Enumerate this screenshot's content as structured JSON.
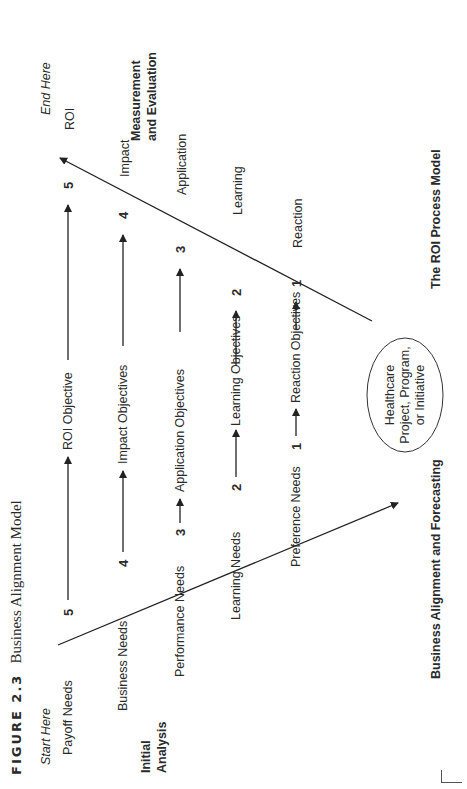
{
  "figure": {
    "label": "FIGURE 2.3",
    "title": "Business Alignment Model"
  },
  "start_label": "Start Here",
  "end_label": "End Here",
  "initial_analysis": [
    "Initial",
    "Analysis"
  ],
  "measurement": [
    "Measurement",
    "and Evaluation"
  ],
  "left_levels": [
    {
      "num": "5",
      "label": "Payoff Needs"
    },
    {
      "num": "4",
      "label": "Business Needs"
    },
    {
      "num": "3",
      "label": "Performance Needs"
    },
    {
      "num": "2",
      "label": "Learning Needs"
    },
    {
      "num": "1",
      "label": "Preference Needs"
    }
  ],
  "objectives": [
    "ROI Objective",
    "Impact Objectives",
    "Application Objectives",
    "Learning Objectives",
    "Reaction Objectives"
  ],
  "right_levels": [
    {
      "num": "5",
      "label": "ROI"
    },
    {
      "num": "4",
      "label": "Impact"
    },
    {
      "num": "3",
      "label": "Application"
    },
    {
      "num": "2",
      "label": "Learning"
    },
    {
      "num": "1",
      "label": "Reaction"
    }
  ],
  "center": {
    "lines": [
      "Healthcare",
      "Project, Program,",
      "or Initiative"
    ]
  },
  "bottom_left_caption": "Business Alignment and Forecasting",
  "bottom_right_caption": "The ROI Process Model"
}
